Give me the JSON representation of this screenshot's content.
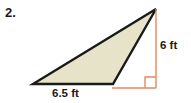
{
  "problem": {
    "number": "2."
  },
  "figure": {
    "type": "triangle",
    "shape_name": "obtuse-triangle",
    "fill_color": "#e7e3c8",
    "outline_color": "#1a1a1a",
    "dimension_color": "#e8875f",
    "vertices": [
      {
        "name": "bottom-left",
        "x": 33,
        "y": 84
      },
      {
        "name": "bottom-right",
        "x": 113,
        "y": 84
      },
      {
        "name": "apex",
        "x": 156,
        "y": 9
      }
    ],
    "labels": {
      "base": "6.5 ft",
      "height": "6 ft"
    },
    "right_angle_marker": {
      "name": "right-angle-marker",
      "x": 145,
      "y": 77,
      "size": 11
    },
    "dimension_lines": {
      "vertical": {
        "x": 156,
        "y1": 9,
        "y2": 88
      },
      "horizontal": {
        "y": 88,
        "x1": 113,
        "x2": 156
      }
    }
  }
}
